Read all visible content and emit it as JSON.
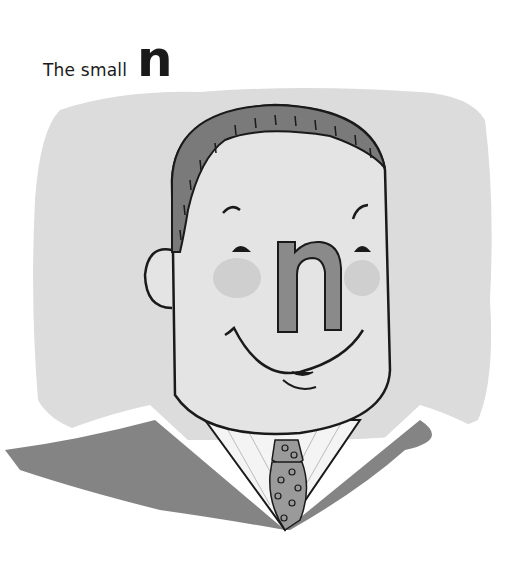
{
  "title": {
    "text": "The small",
    "letter": "n"
  },
  "illustration": {
    "subject": "smiling man in suit and polka-dot tie with a letter n as his nose",
    "nose_letter": "n",
    "colors": {
      "background_wash": "#dcdcdc",
      "face": "#e4e4e4",
      "hair": "#7a7a7a",
      "outline": "#1a1a1a",
      "cheek": "#cfcfcf",
      "nose_letter_fill": "#8a8a8a",
      "suit": "#6e6e6e",
      "shirt": "#f4f4f4",
      "tie": "#9a9a9a"
    }
  }
}
